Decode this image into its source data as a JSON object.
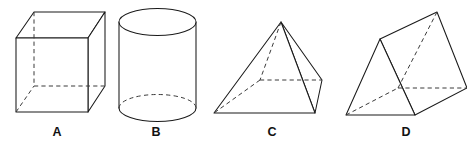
{
  "figure": {
    "background_color": "#ffffff",
    "line_color": "#1a1a1a",
    "hidden_line_color": "#3a3a3a",
    "label_color": "#111111",
    "width": 467,
    "height": 142,
    "shapes": [
      {
        "id": "a",
        "label": "A",
        "name": "cube",
        "label_x": 57,
        "label_y": 136,
        "front_face": "16,38 88,38 88,112 16,112",
        "top_face": "16,38 34,12 105,12 88,38",
        "right_face": "88,38 105,12 105,86 88,112",
        "hidden_vertical": "34,12 34,86",
        "hidden_horizontal_left": "34,86 105,86",
        "hidden_diagonal_bottom": "16,112 34,86"
      },
      {
        "id": "b",
        "label": "B",
        "name": "cylinder",
        "label_x": 156,
        "label_y": 136,
        "center_x": 157.5,
        "top_center_y": 22,
        "bottom_center_y": 108,
        "radius_x": 38.5,
        "radius_y": 13.5,
        "left_side": "119,22 119,108",
        "right_side": "196,22 196,108"
      },
      {
        "id": "c",
        "label": "C",
        "name": "square-pyramid",
        "label_x": 272,
        "label_y": 136,
        "apex": "281,22",
        "base_front_left": "214,113",
        "base_front_right": "315,113",
        "base_back_right": "322,80",
        "base_back_left": "260,80",
        "front_face": "281,22 214,113 315,113",
        "right_face": "281,22 315,113 322,80",
        "hidden_edge_apex_back": "281,22 260,80",
        "hidden_edge_back_left": "260,80 214,113",
        "hidden_edge_back_top": "260,80 322,80"
      },
      {
        "id": "d",
        "label": "D",
        "name": "triangular-prism",
        "label_x": 406,
        "label_y": 136,
        "front_apex": "380,39",
        "front_bottom_left": "346,115",
        "front_bottom_right": "415,115",
        "back_apex": "437,12",
        "back_bottom_right": "467,88",
        "back_bottom_left": "398,88",
        "front_triangle": "380,39 346,115 415,115",
        "top_face": "380,39 437,12 467,88 415,115",
        "hidden_apex_line": "437,12 398,88",
        "hidden_bottom_back": "398,88 467,88",
        "hidden_bottom_left": "346,115 398,88"
      }
    ]
  }
}
